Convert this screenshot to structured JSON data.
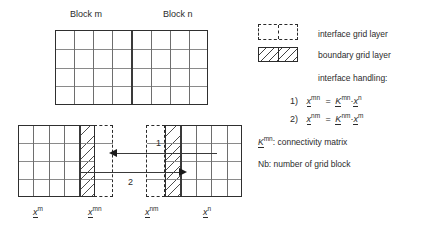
{
  "figure": {
    "top_diagram": {
      "block_m_label": "Block m",
      "block_n_label": "Block n",
      "columns": 8,
      "rows": 4,
      "divider_after_column": 4
    },
    "bottom_diagram": {
      "left_block": {
        "plain_columns": 4,
        "boundary_layer_columns": 1,
        "interface_layer_columns": 1,
        "rows": 4
      },
      "right_block": {
        "plain_columns": 4,
        "boundary_layer_columns": 1,
        "interface_layer_columns": 1,
        "rows": 4
      },
      "arrows": [
        {
          "id": "1",
          "label": "1",
          "direction": "left"
        },
        {
          "id": "2",
          "label": "2",
          "direction": "right"
        }
      ],
      "axis_labels": [
        {
          "base": "x",
          "sup": "m"
        },
        {
          "base": "x",
          "sup": "mn"
        },
        {
          "base": "x",
          "sup": "nm"
        },
        {
          "base": "x",
          "sup": "n"
        }
      ]
    },
    "legend": {
      "interface_label": "interface grid layer",
      "boundary_label": "boundary grid layer",
      "handling_title": "interface handling:",
      "formulas": [
        {
          "index": "1)",
          "lhs_base": "x",
          "lhs_sup": "mn",
          "eq": "=",
          "k_base": "K",
          "k_sup": "mn",
          "dot": "·",
          "rhs_base": "x",
          "rhs_sup": "n"
        },
        {
          "index": "2)",
          "lhs_base": "x",
          "lhs_sup": "nm",
          "eq": "=",
          "k_base": "K",
          "k_sup": "nm",
          "dot": "·",
          "rhs_base": "x",
          "rhs_sup": "m"
        }
      ],
      "k_definition": {
        "base": "K",
        "sup": "mn",
        "text": ": connectivity matrix"
      },
      "nb_definition": "Nb: number of grid block"
    },
    "colors": {
      "frame": "#2f2f2f",
      "gridline": "#8a8a8a",
      "hatch": "#3a3a3a",
      "text": "#2b2b2b",
      "background": "#ffffff"
    }
  }
}
